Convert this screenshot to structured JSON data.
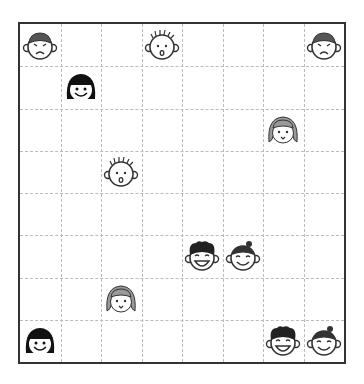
{
  "board": {
    "rows": 8,
    "cols": 8,
    "pieces": [
      {
        "row": 0,
        "col": 0,
        "type": "angry-boy"
      },
      {
        "row": 0,
        "col": 3,
        "type": "spiky-surprised"
      },
      {
        "row": 0,
        "col": 7,
        "type": "angry-boy"
      },
      {
        "row": 1,
        "col": 1,
        "type": "black-hair-girl"
      },
      {
        "row": 2,
        "col": 6,
        "type": "gray-hair-girl"
      },
      {
        "row": 3,
        "col": 2,
        "type": "spiky-surprised"
      },
      {
        "row": 5,
        "col": 4,
        "type": "curly-boy"
      },
      {
        "row": 5,
        "col": 5,
        "type": "bun-girl"
      },
      {
        "row": 6,
        "col": 2,
        "type": "gray-hair-girl"
      },
      {
        "row": 7,
        "col": 0,
        "type": "black-hair-girl"
      },
      {
        "row": 7,
        "col": 6,
        "type": "curly-boy"
      },
      {
        "row": 7,
        "col": 7,
        "type": "bun-girl"
      }
    ]
  }
}
